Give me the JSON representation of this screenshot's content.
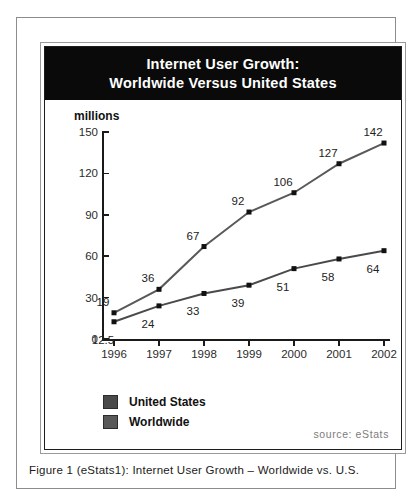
{
  "figure": {
    "caption": "Figure 1 (eStats1): Internet User Growth – Worldwide vs. U.S.",
    "source_note": "source: eStats"
  },
  "title": {
    "line1": "Internet User Growth:",
    "line2": "Worldwide Versus United States"
  },
  "legend": {
    "items": [
      {
        "label": "United States",
        "color": "#4a4a4a"
      },
      {
        "label": "Worldwide",
        "color": "#595959"
      }
    ]
  },
  "chart_data": {
    "type": "line",
    "title": "Internet User Growth: Worldwide Versus United States",
    "xlabel": "",
    "ylabel": "millions",
    "ylim": [
      0,
      150
    ],
    "yticks": [
      0,
      30,
      60,
      90,
      120,
      150
    ],
    "grid": false,
    "legend_position": "below-plot-left",
    "categories": [
      "1996",
      "1997",
      "1998",
      "1999",
      "2000",
      "2001",
      "2002"
    ],
    "series": [
      {
        "name": "Worldwide",
        "color": "#595959",
        "marker": "square",
        "values": [
          19,
          36,
          67,
          92,
          106,
          127,
          142
        ],
        "labels": [
          "19",
          "36",
          "67",
          "92",
          "106",
          "127",
          "142"
        ]
      },
      {
        "name": "United States",
        "color": "#4a4a4a",
        "marker": "square",
        "values": [
          12.5,
          24,
          33,
          39,
          51,
          58,
          64
        ],
        "labels": [
          "12.5",
          "24",
          "33",
          "39",
          "51",
          "58",
          "64"
        ]
      }
    ]
  }
}
